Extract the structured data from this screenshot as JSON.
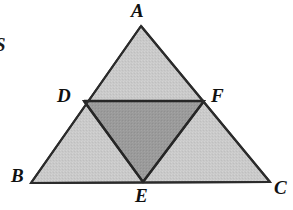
{
  "canvas": {
    "width": 293,
    "height": 210,
    "background_color": "#ffffff"
  },
  "figure": {
    "outer_fill_color": "#c9c9c9",
    "inner_fill_color": "#9a9a9a",
    "stroke_color": "#2b2b2b",
    "stroke_width": 2.1,
    "midline_stroke_width": 2.4
  },
  "points": {
    "A": {
      "label": "A",
      "x": 141,
      "y": 26,
      "label_x": 131,
      "label_y": 1,
      "role": "apex-vertex"
    },
    "B": {
      "label": "B",
      "x": 31,
      "y": 183,
      "label_x": 11,
      "label_y": 166,
      "role": "bottom-left-vertex"
    },
    "C": {
      "label": "C",
      "x": 270,
      "y": 182,
      "label_x": 274,
      "label_y": 178,
      "role": "bottom-right-vertex"
    },
    "D": {
      "label": "D",
      "x": 84,
      "y": 101,
      "label_x": 57,
      "label_y": 86,
      "role": "midpoint-AB"
    },
    "E": {
      "label": "E",
      "x": 143,
      "y": 182,
      "label_x": 135,
      "label_y": 186,
      "role": "midpoint-BC"
    },
    "F": {
      "label": "F",
      "x": 204,
      "y": 101,
      "label_x": 211,
      "label_y": 86,
      "role": "midpoint-AC"
    }
  },
  "polygons": {
    "outer_triangle": {
      "name": "ABC",
      "vertices": "A,B,C",
      "fill": "#c9c9c9"
    },
    "medial_triangle": {
      "name": "DEF",
      "vertices": "D,E,F",
      "fill": "#9a9a9a"
    }
  },
  "segments": [
    {
      "name": "AB",
      "from": "A",
      "to": "B"
    },
    {
      "name": "BC",
      "from": "B",
      "to": "C"
    },
    {
      "name": "CA",
      "from": "C",
      "to": "A"
    },
    {
      "name": "DF",
      "from": "D",
      "to": "F"
    },
    {
      "name": "DE",
      "from": "D",
      "to": "E"
    },
    {
      "name": "EF",
      "from": "E",
      "to": "F"
    }
  ],
  "margin_fragment": {
    "text": "S",
    "x": -5,
    "y": 35,
    "width": 10,
    "height": 24,
    "description": "partially cropped glyph at left page margin"
  }
}
